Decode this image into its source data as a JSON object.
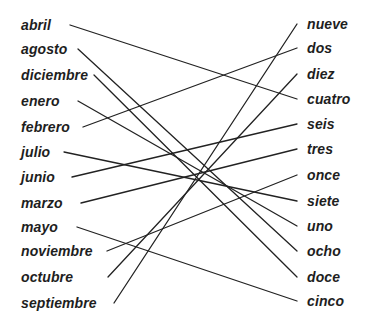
{
  "diagram": {
    "type": "matching-exercise",
    "line_color": "#222222",
    "text_color": "#1e1e1e",
    "left_column": {
      "items": [
        {
          "label": "abril",
          "y": 25,
          "line_start": [
            70,
            25
          ]
        },
        {
          "label": "agosto",
          "y": 49,
          "line_start": [
            78,
            49
          ]
        },
        {
          "label": "diciembre",
          "y": 75,
          "line_start": [
            94,
            75
          ]
        },
        {
          "label": "enero",
          "y": 101,
          "line_start": [
            78,
            101
          ]
        },
        {
          "label": "febrero",
          "y": 127,
          "line_start": [
            83,
            127
          ]
        },
        {
          "label": "julio",
          "y": 152,
          "line_start": [
            64,
            152
          ]
        },
        {
          "label": "junio",
          "y": 177,
          "line_start": [
            72,
            177
          ]
        },
        {
          "label": "marzo",
          "y": 203,
          "line_start": [
            81,
            203
          ]
        },
        {
          "label": "mayo",
          "y": 227,
          "line_start": [
            77,
            227
          ]
        },
        {
          "label": "noviembre",
          "y": 251,
          "line_start": [
            107,
            251
          ]
        },
        {
          "label": "octubre",
          "y": 277,
          "line_start": [
            108,
            277
          ]
        },
        {
          "label": "septiembre",
          "y": 303,
          "line_start": [
            114,
            303
          ]
        }
      ]
    },
    "right_column": {
      "items": [
        {
          "label": "nueve",
          "y": 24,
          "line_end": [
            297,
            24
          ]
        },
        {
          "label": "dos",
          "y": 48,
          "line_end": [
            297,
            48
          ]
        },
        {
          "label": "diez",
          "y": 74,
          "line_end": [
            297,
            74
          ]
        },
        {
          "label": "cuatro",
          "y": 99,
          "line_end": [
            297,
            99
          ]
        },
        {
          "label": "seis",
          "y": 124,
          "line_end": [
            297,
            124
          ]
        },
        {
          "label": "tres",
          "y": 149,
          "line_end": [
            297,
            149
          ]
        },
        {
          "label": "once",
          "y": 175,
          "line_end": [
            297,
            175
          ]
        },
        {
          "label": "siete",
          "y": 201,
          "line_end": [
            297,
            201
          ]
        },
        {
          "label": "uno",
          "y": 226,
          "line_end": [
            297,
            226
          ]
        },
        {
          "label": "ocho",
          "y": 251,
          "line_end": [
            297,
            251
          ]
        },
        {
          "label": "doce",
          "y": 277,
          "line_end": [
            297,
            277
          ]
        },
        {
          "label": "cinco",
          "y": 301,
          "line_end": [
            297,
            301
          ]
        }
      ]
    },
    "connections": [
      {
        "from": "abril",
        "to": "cuatro"
      },
      {
        "from": "agosto",
        "to": "ocho"
      },
      {
        "from": "diciembre",
        "to": "doce"
      },
      {
        "from": "enero",
        "to": "uno"
      },
      {
        "from": "febrero",
        "to": "dos"
      },
      {
        "from": "julio",
        "to": "siete"
      },
      {
        "from": "junio",
        "to": "seis"
      },
      {
        "from": "marzo",
        "to": "tres"
      },
      {
        "from": "mayo",
        "to": "cinco"
      },
      {
        "from": "noviembre",
        "to": "once"
      },
      {
        "from": "octubre",
        "to": "diez"
      },
      {
        "from": "septiembre",
        "to": "nueve"
      }
    ]
  }
}
